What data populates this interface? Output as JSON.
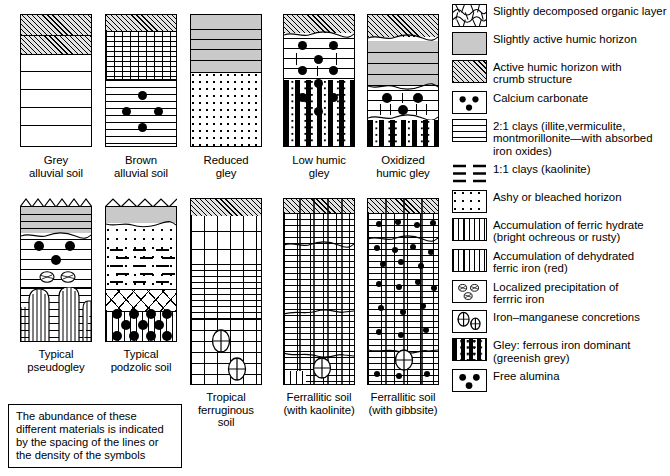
{
  "figure": {
    "note_box": "The abundance of these\ndifferent materials is indicated\nby the spacing of the lines or\nthe density of the symbols"
  },
  "profiles": [
    {
      "id": "grey-alluvial-soil",
      "caption": "Grey\nalluvial soil",
      "row": 1,
      "col": 1
    },
    {
      "id": "brown-alluvial-soil",
      "caption": "Brown\nalluvial soil",
      "row": 1,
      "col": 2
    },
    {
      "id": "reduced-gley",
      "caption": "Reduced\ngley",
      "row": 1,
      "col": 3
    },
    {
      "id": "low-humic-gley",
      "caption": "Low humic\ngley",
      "row": 1,
      "col": 4
    },
    {
      "id": "oxidized-humic-gley",
      "caption": "Oxidized\nhumic gley",
      "row": 1,
      "col": 5
    },
    {
      "id": "typical-pseudogley",
      "caption": "Typical\npseudogley",
      "row": 2,
      "col": 1
    },
    {
      "id": "typical-podzolic-soil",
      "caption": "Typical\npodzolic soil",
      "row": 2,
      "col": 2
    },
    {
      "id": "tropical-ferruginous-soil",
      "caption": "Tropical\nferruginous soil",
      "row": 2,
      "col": 3
    },
    {
      "id": "ferrallitic-soil-kaolinite",
      "caption": "Ferrallitic soil\n(with kaolinite)",
      "row": 2,
      "col": 4
    },
    {
      "id": "ferrallitic-soil-gibbsite",
      "caption": "Ferrallitic soil\n(with gibbsite)",
      "row": 2,
      "col": 5
    }
  ],
  "legend": {
    "items": [
      {
        "icon": "organic-layer-swatch",
        "label": "Slightly decomposed organic layer"
      },
      {
        "icon": "slightly-active-humic-swatch",
        "label": "Slightly active humic horizon"
      },
      {
        "icon": "active-humic-crumb-swatch",
        "label": "Active humic horizon with\ncrumb structure"
      },
      {
        "icon": "calcium-carbonate-swatch",
        "label": "Calcium carbonate"
      },
      {
        "icon": "clays-2-1-swatch",
        "label": "2:1 clays (illite,vermiculite,\nmontmorillonite—with absorbed\niron oxides)"
      },
      {
        "icon": "clays-1-1-swatch",
        "label": "1:1 clays (kaolinite)"
      },
      {
        "icon": "ashy-bleached-swatch",
        "label": "Ashy or bleached horizon"
      },
      {
        "icon": "ferric-hydrate-swatch",
        "label": "Accumulation of ferric hydrate\n(bright ochreous or rusty)"
      },
      {
        "icon": "dehydrated-ferric-iron-swatch",
        "label": "Accumulation of dehydrated\nferric iron (red)"
      },
      {
        "icon": "localized-ferric-precip-swatch",
        "label": "Localized precipitation of\nferrric iron"
      },
      {
        "icon": "iron-manganese-concretions-swatch",
        "label": "Iron–manganese concretions"
      },
      {
        "icon": "gley-ferrous-iron-swatch",
        "label": "Gley: ferrous iron dominant\n(greenish grey)"
      },
      {
        "icon": "free-alumina-swatch",
        "label": "Free alumina"
      }
    ]
  },
  "colors": {
    "humic_grey": "#c9c9c9",
    "hatch_grey": "#e3e3e3",
    "ink": "#000000",
    "paper": "#ffffff"
  }
}
